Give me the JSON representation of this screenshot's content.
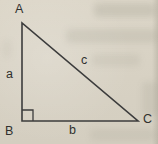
{
  "figure": {
    "line_color": "#3c3c3c",
    "label_color": "#30302e",
    "paper_color": "#d9d3c5"
  },
  "triangle": {
    "vertices": {
      "top": "A",
      "bottom_left": "B",
      "bottom_right": "C"
    },
    "sides": {
      "left": "a",
      "bottom": "b",
      "hypotenuse": "c"
    }
  }
}
